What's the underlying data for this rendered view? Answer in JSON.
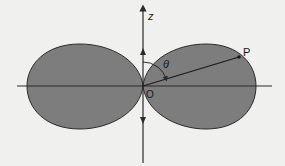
{
  "diagram": {
    "labels": {
      "z_axis": "z",
      "angle": "θ",
      "point": "P",
      "origin": "O"
    },
    "colors": {
      "background": "#f0f0ee",
      "lobe_fill": "#7d7d7d",
      "stroke": "#2a2a2a"
    }
  }
}
